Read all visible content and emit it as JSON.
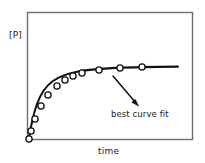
{
  "chart_data": {
    "type": "scatter",
    "title": "",
    "xlabel": "time",
    "ylabel": "[P]",
    "grid": false,
    "legend": null,
    "xlim": [
      0,
      10
    ],
    "ylim": [
      0,
      10
    ],
    "axis_ticks": {
      "x": [],
      "y": []
    },
    "series": [
      {
        "name": "data points",
        "marker": "open-circle",
        "x": [
          0.15,
          0.32,
          0.62,
          1.1,
          1.65,
          2.3,
          3.0,
          3.6,
          4.3,
          5.6,
          7.2,
          8.9
        ],
        "y": [
          0.45,
          1.75,
          3.05,
          4.25,
          5.35,
          6.25,
          6.8,
          7.15,
          7.4,
          7.75,
          7.95,
          8.05
        ],
        "pixel_points": [
          {
            "x": 29,
            "y": 139
          },
          {
            "x": 31,
            "y": 131
          },
          {
            "x": 35,
            "y": 119
          },
          {
            "x": 41,
            "y": 106
          },
          {
            "x": 48,
            "y": 95
          },
          {
            "x": 57,
            "y": 86
          },
          {
            "x": 65,
            "y": 80
          },
          {
            "x": 73,
            "y": 76
          },
          {
            "x": 82,
            "y": 73
          },
          {
            "x": 99,
            "y": 70
          },
          {
            "x": 120,
            "y": 68
          },
          {
            "x": 142,
            "y": 67
          }
        ]
      },
      {
        "name": "best curve fit",
        "marker": "none",
        "style": "solid-line",
        "description": "rising saturation curve approaching a plateau"
      }
    ],
    "annotations": [
      {
        "text": "best curve fit",
        "arrow_from": {
          "x": 137,
          "y": 104
        },
        "arrow_to": {
          "x": 113,
          "y": 76
        }
      }
    ]
  },
  "chart": {
    "y_axis_label": "[P]",
    "x_axis_label": "time",
    "annotation_text": "best curve fit"
  },
  "colors": {
    "frame": "#6e6e6e",
    "curve": "#111111",
    "marker_fill": "#ffffff",
    "marker_stroke": "#111111",
    "text": "#1a1a1a",
    "background": "#ffffff"
  }
}
